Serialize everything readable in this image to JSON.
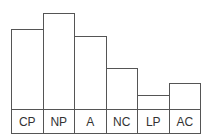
{
  "chart_data": {
    "type": "bar",
    "title": "",
    "xlabel": "",
    "ylabel": "",
    "categories": [
      "CP",
      "NP",
      "A",
      "NC",
      "LP",
      "AC"
    ],
    "values": [
      80,
      96,
      73,
      41,
      14,
      26
    ],
    "grid": false,
    "legend": null
  },
  "colors": {
    "line": "#555555",
    "fill": "#ffffff",
    "text": "#333333"
  }
}
